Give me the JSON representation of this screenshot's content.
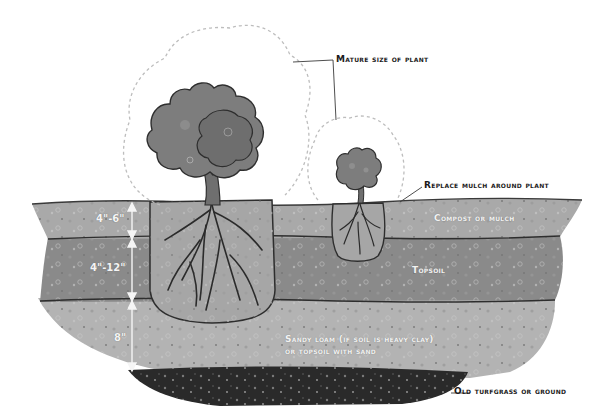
{
  "labels": {
    "mature_size": "Mature size of plant",
    "replace_mulch": "Replace mulch around plant",
    "compost": "Compost or mulch",
    "topsoil": "Topsoil",
    "sandy_loam_line1": "Sandy loam (if soil is heavy clay)",
    "sandy_loam_line2": "or topsoil with sand",
    "old_turfgrass": "Old turfgrass or ground"
  },
  "dimensions": {
    "compost_depth": "4\"-6\"",
    "topsoil_depth": "4\"-12\"",
    "sandy_loam_depth": "8\""
  },
  "colors": {
    "background": "#ffffff",
    "compost_layer": "#a9a9a9",
    "topsoil_layer": "#8a8a8a",
    "sandy_loam_layer": "#b3b3b3",
    "turfgrass_layer": "#2a2a2a",
    "root_ball": "#a6a6a6",
    "foliage": "#7d7d7d",
    "outline": "#2e2e2e",
    "mature_outline": "#bdbdbd"
  }
}
